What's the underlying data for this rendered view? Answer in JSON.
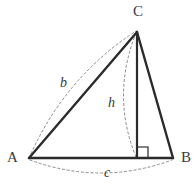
{
  "figure": {
    "colors": {
      "stroke": "#2b2b2b",
      "dashed_stroke": "#8c8c8c",
      "label_text": "#3a3a3a",
      "background": "#ffffff"
    },
    "vertices": [
      {
        "name": "A",
        "label": "A",
        "x": 29,
        "y": 158
      },
      {
        "name": "B",
        "label": "B",
        "x": 173,
        "y": 158
      },
      {
        "name": "C",
        "label": "C",
        "x": 137,
        "y": 32
      }
    ],
    "altitude": {
      "label": "h",
      "from_x": 137,
      "from_y": 32,
      "foot_x": 137,
      "foot_y": 158
    },
    "right_angle": {
      "size": 11,
      "corner_x": 137,
      "corner_y": 158
    },
    "side_labels": [
      {
        "name": "b",
        "label": "b",
        "side": "AC"
      },
      {
        "name": "h",
        "label": "h",
        "side": "altitude"
      },
      {
        "name": "c",
        "label": "c",
        "side": "AB"
      }
    ],
    "paths": {
      "side_ac": "M 29 158 L 137 32",
      "side_cb": "M 137 32 L 173 158",
      "side_ab": "M 29 158 L 173 158",
      "altitude_line": "M 137 32 L 137 158",
      "arc_b": "M 29 158 Q 64 78 136 31",
      "arc_h": "M 136 33 Q 111 96 136 157",
      "arc_c": "M 30 160 Q 101 186 172 160",
      "right_angle_marker": "M 137 147 L 148 147 L 148 158"
    }
  }
}
